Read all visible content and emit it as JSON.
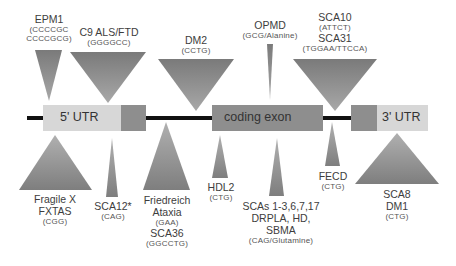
{
  "diagram": {
    "colors": {
      "utr_light": "#d7d7d7",
      "exon_dark": "#8e8e8e",
      "backbone": "#111111",
      "triangle_dark": "#7a7a7a",
      "triangle_light": "#b5b5b5"
    },
    "gene_regions": [
      {
        "id": "five-utr",
        "label": "5' UTR"
      },
      {
        "id": "coding-exon",
        "label": "coding exon"
      },
      {
        "id": "three-utr",
        "label": "3' UTR"
      }
    ],
    "top_expansions": [
      {
        "id": "epm1",
        "lines": [
          "EPM1"
        ],
        "seq_lines": [
          "(CCCCGC",
          "CCCCGCG)"
        ]
      },
      {
        "id": "c9-als-ftd",
        "lines": [
          "C9 ALS/FTD"
        ],
        "seq_lines": [
          "(GGGGCC)"
        ]
      },
      {
        "id": "dm2",
        "lines": [
          "DM2"
        ],
        "seq_lines": [
          "(CCTG)"
        ]
      },
      {
        "id": "opmd",
        "lines": [
          "OPMD"
        ],
        "seq_lines": [
          "(GCG/Alanine)"
        ]
      },
      {
        "id": "sca10-sca31",
        "lines": [
          "SCA10"
        ],
        "seq_lines": [
          "(ATTCT)"
        ],
        "lines2": [
          "SCA31"
        ],
        "seq_lines2": [
          "(TGGAA/TTCCA)"
        ]
      }
    ],
    "bottom_expansions": [
      {
        "id": "fragile-x",
        "lines": [
          "Fragile X",
          "FXTAS"
        ],
        "seq_lines": [
          "(CGG)"
        ]
      },
      {
        "id": "sca12",
        "lines": [
          "SCA12*"
        ],
        "seq_lines": [
          "(CAG)"
        ]
      },
      {
        "id": "friedreich",
        "lines": [
          "Friedreich",
          "Ataxia"
        ],
        "seq_lines": [
          "(GAA)"
        ],
        "lines2": [
          "SCA36"
        ],
        "seq_lines2": [
          "(GGCCTG)"
        ]
      },
      {
        "id": "hdl2",
        "lines": [
          "HDL2"
        ],
        "seq_lines": [
          "(CTG)"
        ]
      },
      {
        "id": "scas",
        "lines": [
          "SCAs 1-3,6,7,17",
          "DRPLA, HD,",
          "SBMA"
        ],
        "seq_lines": [
          "(CAG/Glutamine)"
        ]
      },
      {
        "id": "fecd",
        "lines": [
          "FECD"
        ],
        "seq_lines": [
          "(CTG)"
        ]
      },
      {
        "id": "sca8-dm1",
        "lines": [
          "SCA8",
          "DM1"
        ],
        "seq_lines": [
          "(CTG)"
        ]
      }
    ]
  }
}
